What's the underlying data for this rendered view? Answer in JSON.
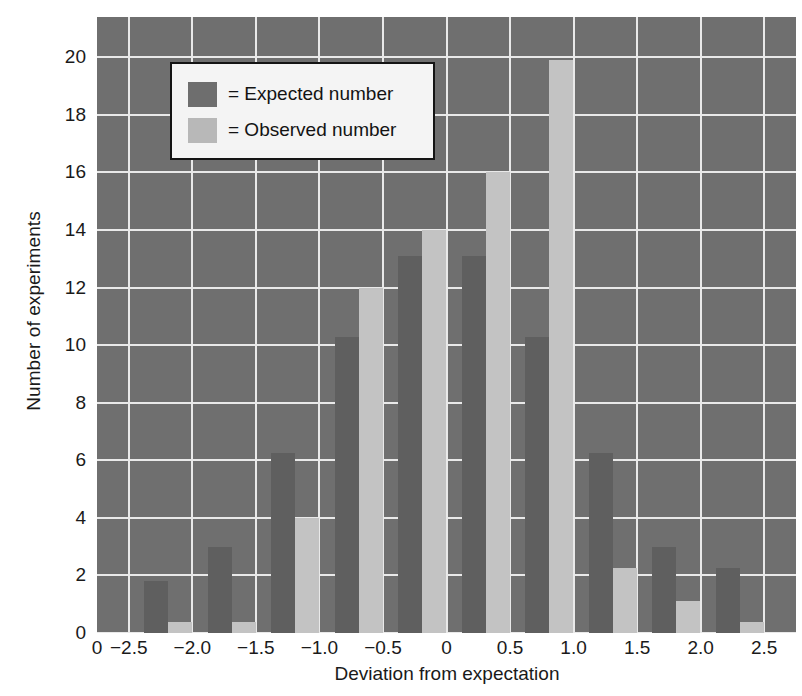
{
  "chart_data": {
    "type": "bar",
    "title": "",
    "xlabel": "Deviation from expectation",
    "ylabel": "Number of experiments",
    "xlim": [
      -2.75,
      2.75
    ],
    "ylim": [
      0,
      21.4
    ],
    "grid": true,
    "xticks": [
      "-2.5",
      "-2.0",
      "-1.5",
      "-1.0",
      "-0.5",
      "0",
      "0.5",
      "1.0",
      "1.5",
      "2.0",
      "2.5"
    ],
    "xtick_values": [
      -2.5,
      -2.0,
      -1.5,
      -1.0,
      -0.5,
      0,
      0.5,
      1.0,
      1.5,
      2.0,
      2.5
    ],
    "yticks": [
      "0",
      "2",
      "4",
      "6",
      "8",
      "10",
      "12",
      "14",
      "16",
      "18",
      "20"
    ],
    "ytick_values": [
      0,
      2,
      4,
      6,
      8,
      10,
      12,
      14,
      16,
      18,
      20
    ],
    "origin_label": "0",
    "legend_position": "upper left",
    "colors": {
      "expected": "#5f5f5f",
      "observed": "#c3c3c3",
      "plot_background": "#6f6f6f",
      "gridline": "#e9e9e9",
      "legend_background": "#f4f4f4",
      "legend_border": "#141414",
      "text": "#1a1a1a"
    },
    "categories": [
      -2.38,
      -1.88,
      -1.38,
      -0.88,
      -0.38,
      0.12,
      0.62,
      1.12,
      1.62,
      2.12
    ],
    "series": [
      {
        "name": "= Expected number",
        "key": "expected",
        "values": [
          1.8,
          3.0,
          6.25,
          10.3,
          13.1,
          13.1,
          10.3,
          6.25,
          3.0,
          2.25
        ]
      },
      {
        "name": "= Observed number",
        "key": "observed",
        "values": [
          0.4,
          0.4,
          4.0,
          12.0,
          14.0,
          16.0,
          19.9,
          2.25,
          1.1,
          0.4
        ]
      }
    ]
  },
  "legend": {
    "items": [
      {
        "label": "= Expected number",
        "swatch": "expected"
      },
      {
        "label": "= Observed number",
        "swatch": "observed"
      }
    ]
  }
}
